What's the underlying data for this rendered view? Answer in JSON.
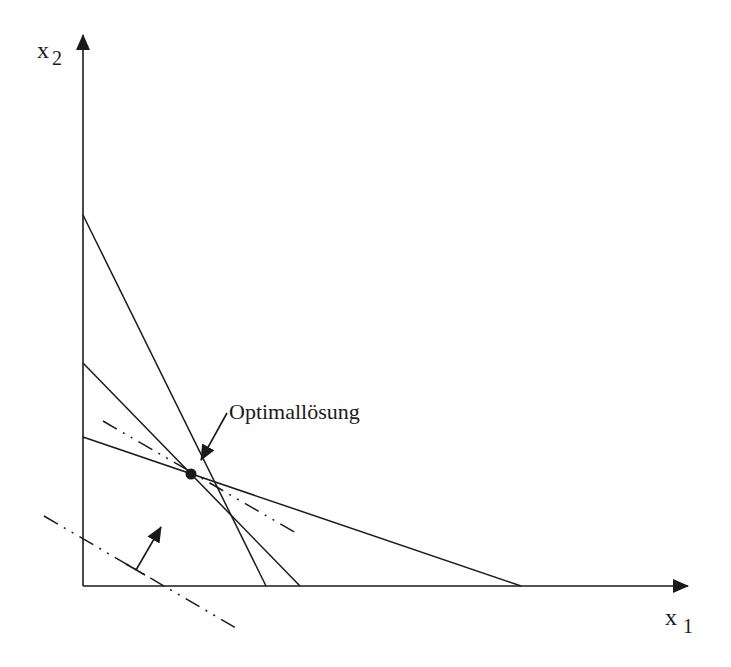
{
  "diagram": {
    "type": "linear-programming-graphical-solution",
    "colors": {
      "ink": "#1a1a1a",
      "background": "#ffffff"
    },
    "axes": {
      "x": {
        "label": "x",
        "subscript": "1",
        "origin": [
          83,
          586
        ],
        "end": [
          688,
          586
        ]
      },
      "y": {
        "label": "x",
        "subscript": "2",
        "origin": [
          83,
          586
        ],
        "end": [
          83,
          35
        ]
      }
    },
    "constraints": [
      {
        "name": "constraint-steep",
        "from": [
          83,
          215
        ],
        "to": [
          266,
          586
        ]
      },
      {
        "name": "constraint-middle",
        "from": [
          83,
          363
        ],
        "to": [
          300,
          586
        ]
      },
      {
        "name": "constraint-shallow",
        "from": [
          83,
          437
        ],
        "to": [
          521,
          586
        ]
      }
    ],
    "objective_lines": [
      {
        "name": "objective-iso-line-optimal",
        "from": [
          103,
          421
        ],
        "to": [
          296,
          533
        ],
        "style": "dash-dot"
      },
      {
        "name": "objective-iso-line-initial",
        "from": [
          44,
          516
        ],
        "to": [
          236,
          628
        ],
        "style": "dash-dot"
      }
    ],
    "improvement_direction": {
      "from": [
        136,
        570
      ],
      "to": [
        161,
        527
      ]
    },
    "optimum": {
      "point": [
        191,
        474
      ],
      "label": "Optimallösung",
      "arrow_from": [
        227,
        413
      ],
      "arrow_to": [
        201,
        460
      ]
    }
  }
}
